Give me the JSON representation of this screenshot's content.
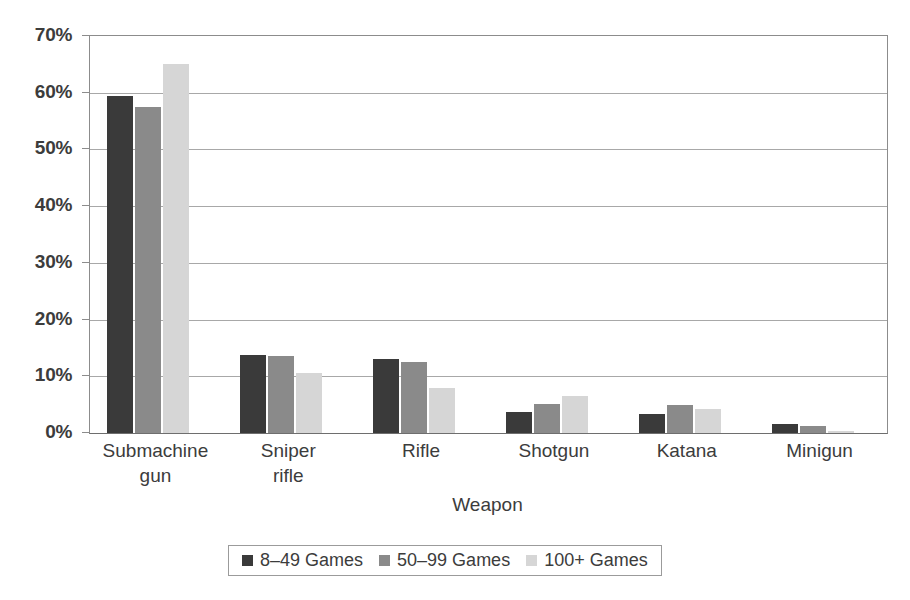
{
  "chart_data": {
    "type": "bar",
    "title": "",
    "subtitle": "",
    "xlabel": "Weapon",
    "ylabel": "",
    "categories": [
      "Submachine\ngun",
      "Sniper\nrifle",
      "Rifle",
      "Shotgun",
      "Katana",
      "Minigun"
    ],
    "series": [
      {
        "name": "8–49 Games",
        "color": "#3a3a3a",
        "values": [
          59.5,
          13.8,
          13.0,
          3.7,
          3.3,
          1.6
        ]
      },
      {
        "name": "50–99 Games",
        "color": "#8a8a8a",
        "values": [
          57.5,
          13.5,
          12.5,
          5.2,
          5.0,
          1.3
        ]
      },
      {
        "name": "100+ Games",
        "color": "#d6d6d6",
        "values": [
          65.0,
          10.5,
          8.0,
          6.6,
          4.2,
          0.4
        ]
      }
    ],
    "ylim": [
      0,
      70
    ],
    "ytick_values": [
      0,
      10,
      20,
      30,
      40,
      50,
      60,
      70
    ],
    "ytick_labels": [
      "0%",
      "10%",
      "20%",
      "30%",
      "40%",
      "50%",
      "60%",
      "70%"
    ],
    "grid": true,
    "grid_axis": "y",
    "legend_position": "bottom-center",
    "legend_border": true,
    "value_unit": "percent"
  },
  "axes": {
    "y_axis_name": "y-axis",
    "x_axis_name": "x-axis"
  }
}
